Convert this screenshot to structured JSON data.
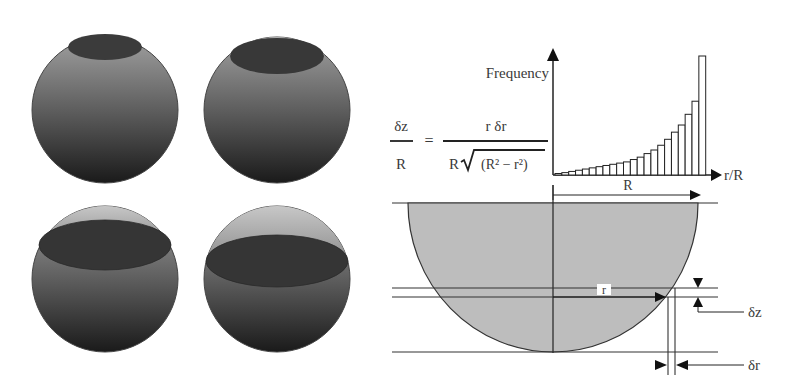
{
  "figure": {
    "spheres": [
      {
        "id": "top-left",
        "cx": 105,
        "cy": 110,
        "r": 73,
        "cap_cy": 47,
        "cap_rx": 37,
        "cap_ry": 13,
        "cap_style": "top"
      },
      {
        "id": "top-right",
        "cx": 277,
        "cy": 110,
        "r": 73,
        "cap_cy": 56,
        "cap_rx": 47,
        "cap_ry": 18,
        "cap_style": "top-rim"
      },
      {
        "id": "bottom-left",
        "cx": 105,
        "cy": 279,
        "r": 73,
        "cap_cy": 245,
        "cap_rx": 66,
        "cap_ry": 25,
        "cap_style": "mid"
      },
      {
        "id": "bottom-right",
        "cx": 277,
        "cy": 279,
        "r": 73,
        "cap_cy": 261,
        "cap_rx": 71,
        "cap_ry": 26,
        "cap_style": "mid"
      }
    ],
    "equation": {
      "lhs_numerator": "δz",
      "lhs_denominator": "R",
      "equals": "=",
      "rhs_numerator": "r δr",
      "rhs_denominator_prefix": "R",
      "rhs_denominator_radicand": "(R² − r²)"
    },
    "histogram_labels": {
      "y_axis": "Frequency",
      "x_axis": "r/R",
      "span_label": "R"
    },
    "hemisphere_labels": {
      "radius": "r",
      "dz": "δz",
      "dr": "δr"
    },
    "colors": {
      "sphere_light": "#8a8a8a",
      "sphere_dark": "#1e1e1e",
      "cap": "#3a3a3a",
      "hemisphere_fill": "#bdbdbd",
      "line": "#222222"
    }
  },
  "chart_data": {
    "type": "bar",
    "title": "",
    "xlabel": "r/R",
    "ylabel": "Frequency",
    "categories": [
      "1",
      "2",
      "3",
      "4",
      "5",
      "6",
      "7",
      "8",
      "9",
      "10",
      "11",
      "12",
      "13",
      "14",
      "15",
      "16",
      "17",
      "18",
      "19",
      "20",
      "21",
      "22"
    ],
    "values": [
      1,
      2,
      3,
      4,
      5,
      6,
      7,
      8,
      9,
      10,
      11,
      13,
      15,
      18,
      21,
      25,
      30,
      36,
      42,
      51,
      62,
      100
    ],
    "ylim": [
      0,
      100
    ],
    "grid": false,
    "legend": null,
    "annotation": "Bar heights grow toward r/R = 1 (relative values)"
  }
}
